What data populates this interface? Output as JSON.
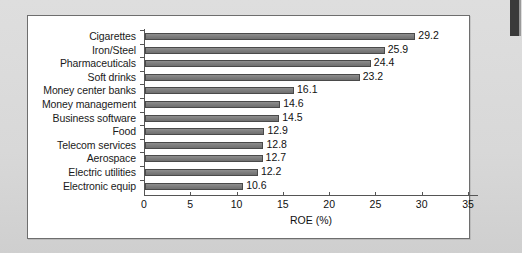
{
  "chart_data": {
    "type": "bar",
    "orientation": "horizontal",
    "title": "",
    "xlabel": "ROE (%)",
    "ylabel": "",
    "xlim": [
      0,
      35
    ],
    "xticks": [
      0,
      5,
      10,
      15,
      20,
      25,
      30,
      35
    ],
    "grid": false,
    "legend": null,
    "categories": [
      "Cigarettes",
      "Iron/Steel",
      "Pharmaceuticals",
      "Soft drinks",
      "Money center banks",
      "Money management",
      "Business software",
      "Food",
      "Telecom services",
      "Aerospace",
      "Electric utilities",
      "Electronic equip"
    ],
    "values": [
      29.2,
      25.9,
      24.4,
      23.2,
      16.1,
      14.6,
      14.5,
      12.9,
      12.8,
      12.7,
      12.2,
      10.6
    ],
    "value_labels": [
      "29.2",
      "25.9",
      "24.4",
      "23.2",
      "16.1",
      "14.6",
      "14.5",
      "12.9",
      "12.8",
      "12.7",
      "12.2",
      "10.6"
    ],
    "bar_color": "#7d7d7d",
    "bar_border_color": "#4a4a4a",
    "axis_color": "#555555",
    "panel_background": "#ffffff",
    "page_background": "#d9d9d9"
  }
}
